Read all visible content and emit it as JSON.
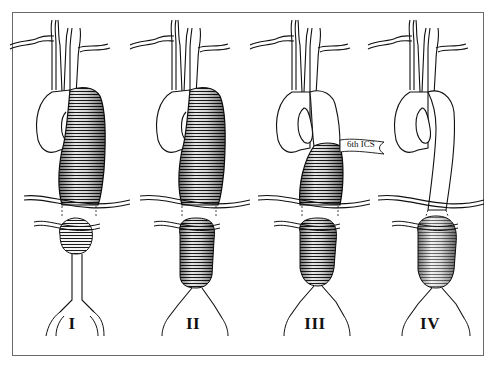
{
  "figure": {
    "panels": [
      {
        "id": "I",
        "label": "I",
        "center_x": 72
      },
      {
        "id": "II",
        "label": "II",
        "center_x": 193
      },
      {
        "id": "III",
        "label": "III",
        "center_x": 315,
        "annotation": "6th ICS"
      },
      {
        "id": "IV",
        "label": "IV",
        "center_x": 430
      }
    ],
    "annotation_label": "6th ICS",
    "colors": {
      "ink": "#111111",
      "frame": "#6a6a6a",
      "background": "#ffffff"
    }
  }
}
